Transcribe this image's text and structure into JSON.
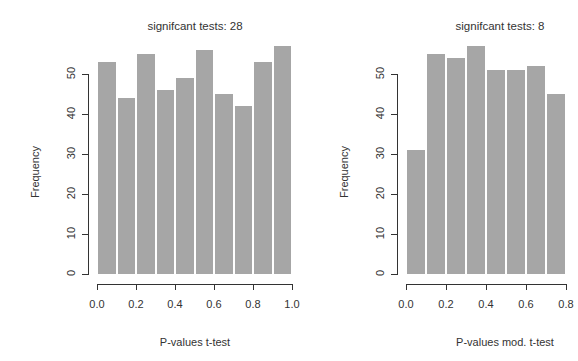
{
  "chart_data": [
    {
      "type": "bar",
      "title": "signifcant tests: 28",
      "xlabel": "P-values t-test",
      "ylabel": "Frequency",
      "bin_edges": [
        0.0,
        0.1,
        0.2,
        0.3,
        0.4,
        0.5,
        0.6,
        0.7,
        0.8,
        0.9,
        1.0
      ],
      "categories": [
        "0.0-0.1",
        "0.1-0.2",
        "0.2-0.3",
        "0.3-0.4",
        "0.4-0.5",
        "0.5-0.6",
        "0.6-0.7",
        "0.7-0.8",
        "0.8-0.9",
        "0.9-1.0"
      ],
      "values": [
        53,
        44,
        55,
        46,
        49,
        56,
        45,
        42,
        53,
        57
      ],
      "x_ticks": [
        "0.0",
        "0.2",
        "0.4",
        "0.6",
        "0.8",
        "1.0"
      ],
      "y_ticks": [
        "0",
        "10",
        "20",
        "30",
        "40",
        "50"
      ],
      "xlim": [
        0,
        1
      ],
      "ylim": [
        0,
        57
      ],
      "grid": false,
      "bar_color": "#a6a6a6"
    },
    {
      "type": "bar",
      "title": "signifcant tests: 8",
      "xlabel": "P-values mod. t-test",
      "ylabel": "Frequency",
      "bin_edges": [
        0.0,
        0.1,
        0.2,
        0.3,
        0.4,
        0.5,
        0.6,
        0.7,
        0.8
      ],
      "categories": [
        "0.0-0.1",
        "0.1-0.2",
        "0.2-0.3",
        "0.3-0.4",
        "0.4-0.5",
        "0.5-0.6",
        "0.6-0.7",
        "0.7-0.8"
      ],
      "values": [
        31,
        55,
        54,
        57,
        51,
        51,
        52,
        45
      ],
      "x_ticks": [
        "0.0",
        "0.2",
        "0.4",
        "0.6",
        "0.8"
      ],
      "x_ticks_note": "last tick label partially cut off at right edge",
      "y_ticks": [
        "0",
        "10",
        "20",
        "30",
        "40",
        "50"
      ],
      "xlim": [
        0,
        1
      ],
      "ylim": [
        0,
        57
      ],
      "grid": false,
      "bar_color": "#a6a6a6"
    }
  ]
}
